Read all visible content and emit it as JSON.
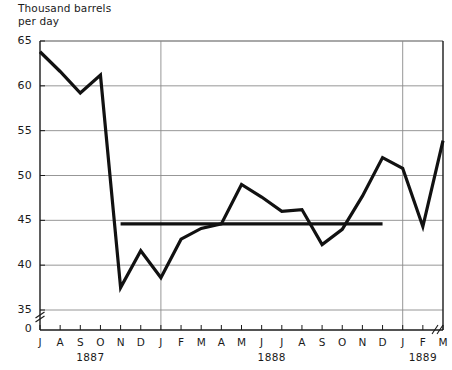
{
  "chart_data": {
    "type": "line",
    "title": "Thousand barrels\nper day",
    "xlabel": "",
    "ylabel": "Thousand barrels per day",
    "ylim": [
      35,
      65
    ],
    "yticks": [
      35,
      40,
      45,
      50,
      55,
      60,
      65
    ],
    "ytick_labels": [
      "35",
      "40",
      "45",
      "50",
      "55",
      "60",
      "65"
    ],
    "zero_tick_label": "0",
    "y_axis_broken": true,
    "x_axis_broken_right": true,
    "grid": true,
    "legend": "none",
    "categories": [
      "J",
      "A",
      "S",
      "O",
      "N",
      "D",
      "J",
      "F",
      "M",
      "A",
      "M",
      "J",
      "J",
      "A",
      "S",
      "O",
      "N",
      "D",
      "J",
      "F",
      "M"
    ],
    "x_tick_labels": [
      "J",
      "A",
      "S",
      "O",
      "N",
      "D",
      "J",
      "F",
      "M",
      "A",
      "M",
      "J",
      "J",
      "A",
      "S",
      "O",
      "N",
      "D",
      "J",
      "F",
      "M"
    ],
    "year_groups": [
      {
        "label": "1887",
        "start_index": 0,
        "end_index": 5
      },
      {
        "label": "1888",
        "start_index": 6,
        "end_index": 17
      },
      {
        "label": "1889",
        "start_index": 18,
        "end_index": 20
      }
    ],
    "year_divider_indices": [
      6,
      18
    ],
    "series": [
      {
        "name": "Production",
        "values": [
          63.8,
          61.6,
          59.2,
          61.2,
          37.5,
          41.6,
          38.6,
          42.9,
          44.1,
          44.6,
          49.0,
          47.6,
          46.0,
          46.2,
          42.3,
          44.0,
          47.7,
          52.0,
          50.8,
          44.3,
          53.9
        ]
      }
    ],
    "reference_line": {
      "name": "Average",
      "value": 44.6,
      "start_index": 4,
      "end_index": 17
    },
    "line_color": "#111111",
    "grid_color": "#8b8b8b",
    "axis_color": "#1a1a1a"
  }
}
